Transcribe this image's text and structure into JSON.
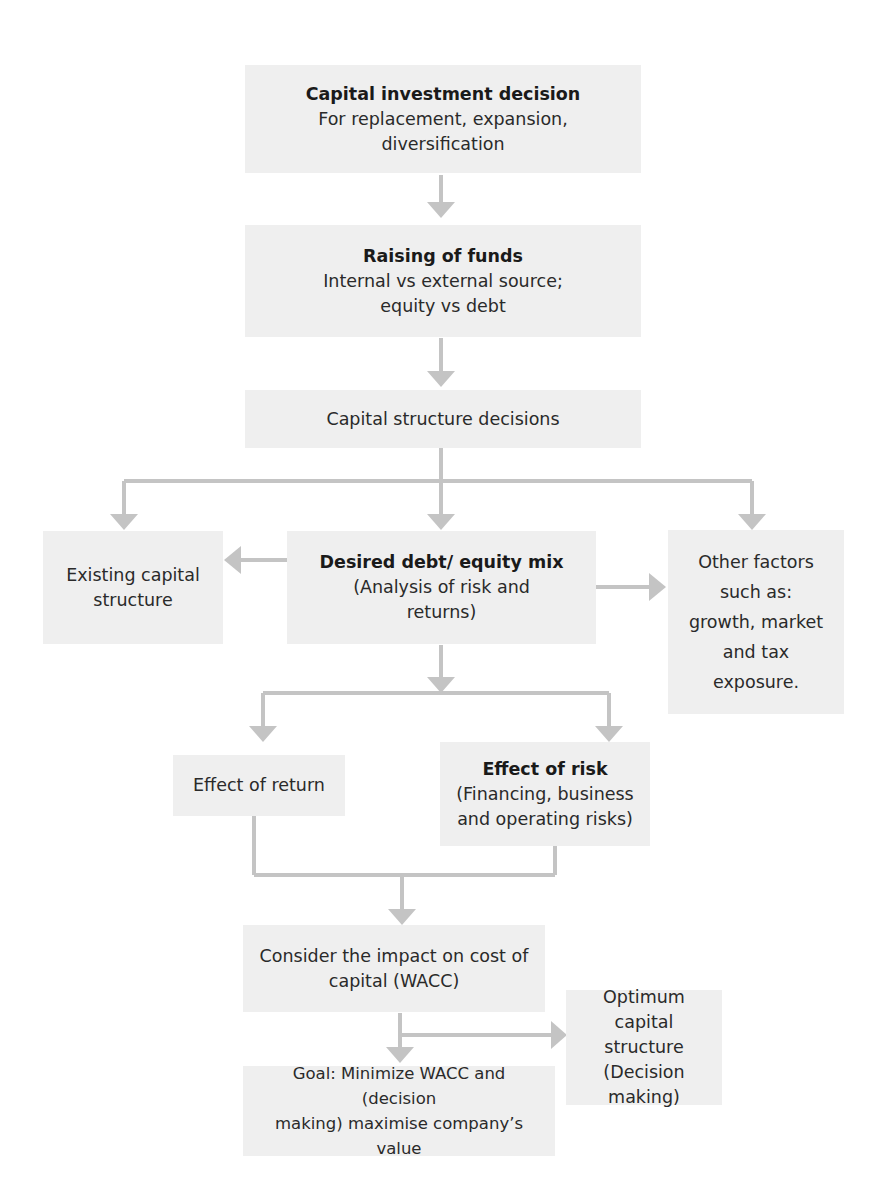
{
  "diagram": {
    "type": "flowchart",
    "colors": {
      "box_fill": "#efefef",
      "arrow": "#c4c4c4",
      "text": "#2a2a2a"
    },
    "nodes": {
      "capital_investment": {
        "title": "Capital investment decision",
        "lines": [
          "For replacement, expansion,",
          "diversification"
        ]
      },
      "raising_funds": {
        "title": "Raising of funds",
        "lines": [
          "Internal vs external source;",
          "equity vs debt"
        ]
      },
      "capital_structure_decisions": {
        "lines": [
          "Capital structure decisions"
        ]
      },
      "existing_capital_structure": {
        "lines": [
          "Existing capital",
          "structure"
        ]
      },
      "desired_mix": {
        "title": "Desired debt/ equity mix",
        "lines": [
          "(Analysis of risk and",
          "returns)"
        ]
      },
      "other_factors": {
        "lines": [
          "Other factors",
          "such as:",
          "growth, market",
          "and tax",
          "exposure."
        ]
      },
      "effect_of_return": {
        "lines": [
          "Effect of return"
        ]
      },
      "effect_of_risk": {
        "title": "Effect of risk",
        "lines": [
          "(Financing, business",
          "and operating risks)"
        ]
      },
      "cost_of_capital": {
        "lines": [
          "Consider the impact on cost of",
          "capital (WACC)"
        ]
      },
      "optimum_structure": {
        "lines": [
          "Optimum",
          "capital structure",
          "(Decision making)"
        ]
      },
      "goal": {
        "lines": [
          "Goal: Minimize WACC and (decision",
          "making) maximise company’s value"
        ]
      }
    },
    "edges": [
      [
        "capital_investment",
        "raising_funds"
      ],
      [
        "raising_funds",
        "capital_structure_decisions"
      ],
      [
        "capital_structure_decisions",
        "existing_capital_structure"
      ],
      [
        "capital_structure_decisions",
        "desired_mix"
      ],
      [
        "capital_structure_decisions",
        "other_factors"
      ],
      [
        "desired_mix",
        "existing_capital_structure"
      ],
      [
        "desired_mix",
        "other_factors"
      ],
      [
        "desired_mix",
        "effect_of_return"
      ],
      [
        "desired_mix",
        "effect_of_risk"
      ],
      [
        "effect_of_return",
        "cost_of_capital"
      ],
      [
        "effect_of_risk",
        "cost_of_capital"
      ],
      [
        "cost_of_capital",
        "goal"
      ],
      [
        "cost_of_capital",
        "optimum_structure"
      ]
    ]
  }
}
